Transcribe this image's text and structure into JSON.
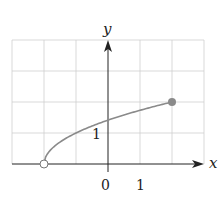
{
  "chart_data": {
    "type": "line",
    "title": "",
    "function": "y = sqrt(x + 2)",
    "xlabel": "x",
    "ylabel": "y",
    "x_tick_labels": [
      "0",
      "1"
    ],
    "y_tick_labels": [
      "1"
    ],
    "xlim": [
      -3,
      3
    ],
    "ylim": [
      0,
      4
    ],
    "grid": true,
    "series": [
      {
        "name": "f",
        "x": [
          -2,
          -1.5,
          -1,
          -0.5,
          0,
          0.5,
          1,
          1.5,
          2
        ],
        "y": [
          0,
          0.71,
          1,
          1.22,
          1.41,
          1.58,
          1.73,
          1.87,
          2
        ],
        "color": "#8a8a8a"
      }
    ],
    "endpoints": [
      {
        "x": -2,
        "y": 0,
        "style": "open"
      },
      {
        "x": 2,
        "y": 2,
        "style": "closed"
      }
    ]
  },
  "labels": {
    "x_axis": "x",
    "y_axis": "y",
    "origin": "0",
    "x_one": "1",
    "y_one": "1"
  }
}
